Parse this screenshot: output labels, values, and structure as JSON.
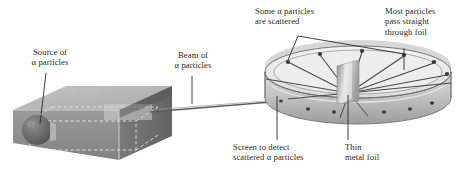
{
  "diagram": {
    "background_color": "#ffffff",
    "text_color": "#231f20",
    "labels": {
      "source": "Source of\nα particles",
      "beam": "Beam of\nα particles",
      "scattered": "Some α particles\nare scattered",
      "pass_through": "Most particles\npass straight\nthrough foil",
      "screen": "Screen to detect\nscattered α particles",
      "foil": "Thin\nmetal foil"
    },
    "parts": {
      "source_box": {
        "name": "lead source block",
        "top_face_color": "#b5b5b5",
        "front_face_color": "#8d8d8d",
        "right_face_color": "#6e6e6e",
        "dashed_line_color": "#f2f2f2"
      },
      "alpha_source_sphere": {
        "name": "alpha particle source",
        "color": "#5a5a5a",
        "highlight_color": "#8a8a8a"
      },
      "beam": {
        "name": "alpha particle beam",
        "color": "#5c5c5c"
      },
      "detector_ring": {
        "name": "zinc sulfide detector screen",
        "band_color": "#c9c9c9",
        "band_shadow": "#9a9a9a",
        "inner_color": "#e3e3e3",
        "edge_color": "#6a6a6a",
        "detection_dot_color": "#3a3a3a",
        "detection_dot_count": 12
      },
      "metal_foil": {
        "name": "thin metal foil",
        "color": "#a8a8a8",
        "highlight_color": "#dcdcdc"
      },
      "scatter_rays": {
        "name": "scattered alpha particle paths",
        "color": "#4a4a4a",
        "count": 9
      },
      "leader_lines": {
        "color": "#2b2b2b",
        "width": 0.9
      }
    }
  }
}
